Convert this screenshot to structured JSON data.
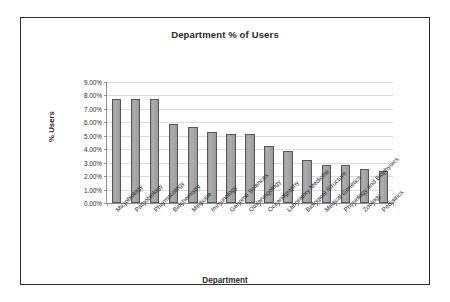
{
  "chart_data": {
    "type": "bar",
    "title": "Department % of Users",
    "xlabel": "Department",
    "ylabel": "% Users",
    "ylim": [
      0,
      9
    ],
    "ytick_labels": [
      "9.00%",
      "8.00%",
      "7.00%",
      "6.00%",
      "5.00%",
      "4.00%",
      "3.00%",
      "2.00%",
      "1.00%",
      "0.00%"
    ],
    "ytick_values": [
      9,
      8,
      7,
      6,
      5,
      4,
      3,
      2,
      1,
      0
    ],
    "grid": true,
    "legend": "none",
    "categories": [
      "Microbiology",
      "Pathobiology",
      "Pharmacology",
      "Biochemistry",
      "Medicine",
      "Immunology",
      "Genome Sciences",
      "Otolaryngology",
      "Oceanography",
      "Laboratory Medicine",
      "Biological Structure",
      "Medical Genetics",
      "Physiology and Biophysics",
      "Zoology",
      "Pediatrics"
    ],
    "values": [
      7.75,
      7.75,
      7.75,
      5.85,
      5.65,
      5.3,
      5.1,
      5.1,
      4.25,
      3.85,
      3.2,
      2.8,
      2.8,
      2.55,
      2.35
    ],
    "series": [
      {
        "name": "% Users",
        "values": [
          7.75,
          7.75,
          7.75,
          5.85,
          5.65,
          5.3,
          5.1,
          5.1,
          4.25,
          3.85,
          3.2,
          2.8,
          2.8,
          2.55,
          2.35
        ]
      }
    ],
    "bar_fill_color": "#a3a3a3",
    "bar_border_color": "#57575c",
    "gridline_color": "#dcdcdc",
    "axis_color": "#8f8f8f",
    "text_color": "#2a2a2a",
    "frame_color": "#2b2b33",
    "background_color": "#ffffff"
  }
}
